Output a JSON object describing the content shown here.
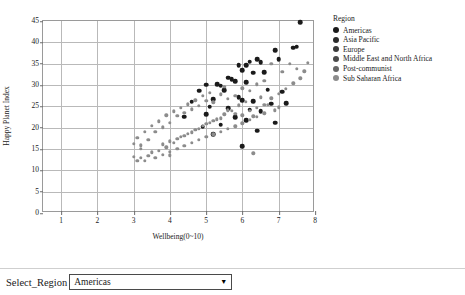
{
  "chart_data": {
    "type": "scatter",
    "title": "",
    "xlabel": "Wellbeing(0~10)",
    "ylabel": "Happy Planet Index",
    "xlim": [
      0.5,
      8.0
    ],
    "ylim": [
      0,
      45
    ],
    "xticks": [
      1,
      2,
      3,
      4,
      5,
      6,
      7,
      8
    ],
    "yticks": [
      0,
      5,
      10,
      15,
      20,
      25,
      30,
      35,
      40,
      45
    ],
    "grid": true,
    "legend_position": "right",
    "legend_title": "Region",
    "highlighted_series": "Americas",
    "colors": {
      "highlight": "#1a1a1a",
      "other": "#8c8c8c"
    },
    "series": [
      {
        "name": "Americas",
        "color": "#1a1a1a",
        "highlighted": true,
        "points": [
          [
            7.6,
            44.7
          ],
          [
            7.5,
            39.0
          ],
          [
            7.4,
            38.7
          ],
          [
            7.0,
            36.0
          ],
          [
            6.9,
            38.1
          ],
          [
            6.5,
            35.4
          ],
          [
            6.4,
            36.1
          ],
          [
            6.2,
            35.5
          ],
          [
            6.1,
            34.7
          ],
          [
            5.9,
            34.6
          ],
          [
            6.0,
            33.5
          ],
          [
            6.3,
            32.9
          ],
          [
            6.6,
            33.0
          ],
          [
            5.6,
            31.7
          ],
          [
            5.7,
            31.3
          ],
          [
            5.8,
            30.9
          ],
          [
            6.1,
            30.6
          ],
          [
            5.0,
            30.1
          ],
          [
            5.3,
            30.2
          ],
          [
            5.4,
            29.8
          ],
          [
            5.5,
            28.8
          ],
          [
            4.8,
            28.7
          ],
          [
            6.7,
            28.9
          ],
          [
            7.1,
            28.4
          ],
          [
            5.9,
            27.2
          ],
          [
            6.0,
            26.5
          ],
          [
            6.3,
            26.2
          ],
          [
            6.8,
            25.6
          ],
          [
            7.2,
            25.8
          ],
          [
            5.2,
            26.7
          ],
          [
            4.6,
            26.1
          ],
          [
            5.1,
            24.9
          ],
          [
            5.6,
            24.5
          ],
          [
            6.2,
            24.2
          ],
          [
            6.5,
            23.8
          ],
          [
            5.0,
            23.2
          ],
          [
            4.4,
            22.6
          ],
          [
            5.8,
            22.4
          ],
          [
            6.1,
            21.8
          ],
          [
            6.9,
            21.2
          ],
          [
            5.4,
            20.7
          ],
          [
            4.9,
            20.2
          ],
          [
            6.4,
            19.3
          ],
          [
            5.2,
            18.4
          ],
          [
            6.0,
            15.6
          ]
        ]
      },
      {
        "name": "Asia Pacific",
        "color": "#8c8c8c",
        "highlighted": false,
        "points": [
          [
            7.8,
            35.2
          ],
          [
            7.7,
            33.2
          ],
          [
            7.5,
            33.8
          ],
          [
            7.3,
            34.9
          ],
          [
            7.1,
            33.1
          ],
          [
            6.8,
            35.0
          ],
          [
            6.6,
            31.0
          ],
          [
            6.4,
            30.2
          ],
          [
            6.2,
            28.6
          ],
          [
            6.0,
            29.2
          ],
          [
            5.8,
            27.4
          ],
          [
            5.6,
            26.8
          ],
          [
            5.4,
            27.8
          ],
          [
            5.2,
            25.9
          ],
          [
            5.0,
            26.3
          ],
          [
            4.8,
            25.1
          ],
          [
            4.6,
            24.3
          ],
          [
            4.4,
            23.5
          ],
          [
            4.2,
            22.8
          ],
          [
            4.0,
            21.2
          ],
          [
            3.8,
            20.1
          ],
          [
            3.6,
            19.0
          ],
          [
            3.4,
            17.2
          ],
          [
            3.2,
            15.9
          ],
          [
            3.0,
            13.1
          ]
        ]
      },
      {
        "name": "Europe",
        "color": "#8c8c8c",
        "highlighted": false,
        "points": [
          [
            7.6,
            31.6
          ],
          [
            7.4,
            30.4
          ],
          [
            7.2,
            29.1
          ],
          [
            7.0,
            27.9
          ],
          [
            6.8,
            26.9
          ],
          [
            6.6,
            25.3
          ],
          [
            6.4,
            24.6
          ],
          [
            6.2,
            23.9
          ],
          [
            6.0,
            22.9
          ],
          [
            5.8,
            23.3
          ],
          [
            5.6,
            24.1
          ],
          [
            5.4,
            22.2
          ],
          [
            5.2,
            21.6
          ],
          [
            5.0,
            20.9
          ],
          [
            4.8,
            19.8
          ],
          [
            4.6,
            18.9
          ],
          [
            4.4,
            18.1
          ],
          [
            4.2,
            17.4
          ],
          [
            4.0,
            16.8
          ],
          [
            3.8,
            16.1
          ],
          [
            3.5,
            14.2
          ],
          [
            3.2,
            12.9
          ]
        ]
      },
      {
        "name": "Middle East and North Africa",
        "color": "#8c8c8c",
        "highlighted": false,
        "points": [
          [
            7.0,
            24.8
          ],
          [
            6.7,
            25.4
          ],
          [
            6.5,
            27.1
          ],
          [
            6.3,
            22.7
          ],
          [
            6.1,
            26.0
          ],
          [
            5.9,
            25.2
          ],
          [
            5.7,
            24.0
          ],
          [
            5.5,
            23.1
          ],
          [
            5.3,
            22.0
          ],
          [
            5.1,
            21.1
          ],
          [
            4.9,
            20.4
          ],
          [
            4.7,
            19.5
          ],
          [
            4.5,
            18.6
          ],
          [
            4.3,
            17.8
          ],
          [
            4.1,
            16.5
          ],
          [
            3.9,
            15.4
          ],
          [
            3.7,
            14.6
          ],
          [
            3.4,
            13.4
          ],
          [
            3.1,
            12.2
          ]
        ]
      },
      {
        "name": "Post-communist",
        "color": "#8c8c8c",
        "highlighted": false,
        "points": [
          [
            6.9,
            24.1
          ],
          [
            6.6,
            23.4
          ],
          [
            6.4,
            22.6
          ],
          [
            6.2,
            21.9
          ],
          [
            6.0,
            21.0
          ],
          [
            5.8,
            20.3
          ],
          [
            5.6,
            19.7
          ],
          [
            5.4,
            19.0
          ],
          [
            5.2,
            18.4
          ],
          [
            5.0,
            17.9
          ],
          [
            4.8,
            17.2
          ],
          [
            4.6,
            16.4
          ],
          [
            4.4,
            15.8
          ],
          [
            4.2,
            15.1
          ],
          [
            4.0,
            14.4
          ],
          [
            3.8,
            13.7
          ],
          [
            3.6,
            13.0
          ],
          [
            3.3,
            12.3
          ]
        ]
      },
      {
        "name": "Sub Saharan Africa",
        "color": "#8c8c8c",
        "highlighted": false,
        "points": [
          [
            5.5,
            29.6
          ],
          [
            5.1,
            28.2
          ],
          [
            4.9,
            27.5
          ],
          [
            4.7,
            26.4
          ],
          [
            4.5,
            25.5
          ],
          [
            4.3,
            24.7
          ],
          [
            4.1,
            23.8
          ],
          [
            3.9,
            22.9
          ],
          [
            3.7,
            21.5
          ],
          [
            3.5,
            20.4
          ],
          [
            3.3,
            19.1
          ],
          [
            3.1,
            17.6
          ],
          [
            3.0,
            16.2
          ],
          [
            4.0,
            13.5
          ],
          [
            3.2,
            15.0
          ],
          [
            6.3,
            14.0
          ]
        ]
      }
    ]
  },
  "legend": {
    "title": "Region",
    "items": [
      {
        "label": "Americas",
        "color": "#1a1a1a"
      },
      {
        "label": "Asia Pacific",
        "color": "#2b2b2b"
      },
      {
        "label": "Europe",
        "color": "#3a3a3a"
      },
      {
        "label": "Middle East and North Africa",
        "color": "#4a4a4a"
      },
      {
        "label": "Post-communist",
        "color": "#666666"
      },
      {
        "label": "Sub Saharan Africa",
        "color": "#8c8c8c"
      }
    ]
  },
  "controls": {
    "select_label": "Select_Region",
    "selected_region": "Americas",
    "caret_icon": "▼",
    "options": [
      "Americas",
      "Asia Pacific",
      "Europe",
      "Middle East and North Africa",
      "Post-communist",
      "Sub Saharan Africa"
    ]
  }
}
